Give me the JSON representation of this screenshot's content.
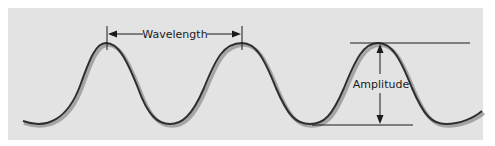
{
  "diagram": {
    "labels": {
      "wavelength": "Wavelength",
      "amplitude": "Amplitude"
    },
    "colors": {
      "background": "#e3e3e3",
      "wave": "#3a3a3a",
      "wave_shadow": "#8a8a8a",
      "lines": "#1a1a1a"
    }
  }
}
